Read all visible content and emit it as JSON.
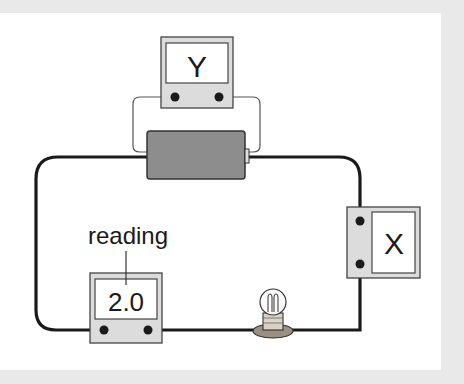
{
  "diagram": {
    "type": "electric circuit",
    "components": {
      "battery": {
        "label": ""
      },
      "meter_y": {
        "label": "Y",
        "connection": "parallel across battery"
      },
      "meter_x": {
        "label": "X",
        "connection": "series in right branch"
      },
      "meter_reading": {
        "display": "2.0",
        "connection": "series in bottom branch"
      },
      "bulb": {
        "label": ""
      }
    },
    "annotation": {
      "text": "reading"
    },
    "colors": {
      "wire": "#1a1a1a",
      "thin_wire": "#555555",
      "battery": "#8a8a8a",
      "meter_case": "#dcdcdc",
      "meter_screen": "#ffffff",
      "background": "#ffffff",
      "border": "#e9e9e9"
    }
  }
}
